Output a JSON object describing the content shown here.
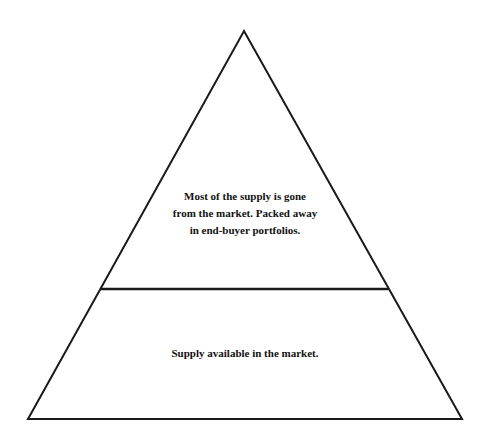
{
  "diagram": {
    "type": "pyramid",
    "colors": {
      "stroke": "#1a1a1a",
      "fill": "#ffffff",
      "text": "#111111"
    },
    "layers": [
      {
        "position": "top",
        "text": "Most of the supply is gone from the market. Packed away in end-buyer portfolios.",
        "lines": [
          "Most of the supply is gone",
          "from the market. Packed away",
          "in end-buyer portfolios."
        ]
      },
      {
        "position": "bottom",
        "text": "Supply available in the market.",
        "lines": [
          "Supply available in the market."
        ]
      }
    ]
  }
}
